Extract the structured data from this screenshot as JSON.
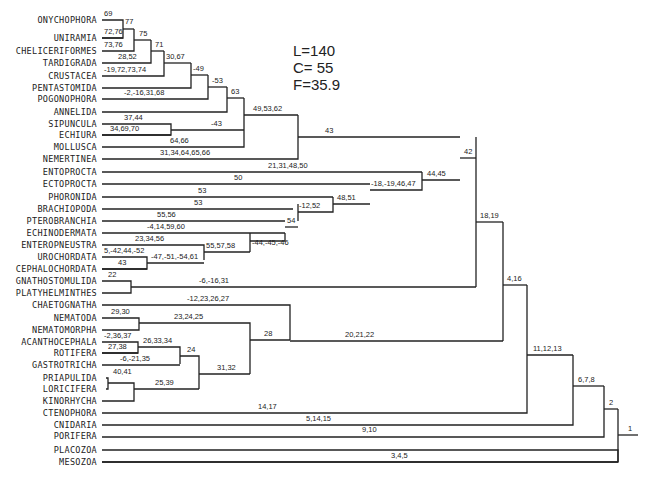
{
  "stats": {
    "L": "L=140",
    "C": "C= 55",
    "F": "F=35.9"
  },
  "taxa": [
    {
      "id": "onychophora",
      "name": "ONYCHOPHORA",
      "y": 20
    },
    {
      "id": "uniramia",
      "name": "UNIRAMIA",
      "y": 38
    },
    {
      "id": "cheliceriformes",
      "name": "CHELICERIFORMES",
      "y": 51
    },
    {
      "id": "tardigrada",
      "name": "TARDIGRADA",
      "y": 63
    },
    {
      "id": "crustacea",
      "name": "CRUSTACEA",
      "y": 76
    },
    {
      "id": "pentastomida",
      "name": "PENTASTOMIDA",
      "y": 88
    },
    {
      "id": "pogonophora",
      "name": "POGONOPHORA",
      "y": 99
    },
    {
      "id": "annelida",
      "name": "ANNELIDA",
      "y": 112
    },
    {
      "id": "sipuncula",
      "name": "SIPUNCULA",
      "y": 124
    },
    {
      "id": "echiura",
      "name": "ECHIURA",
      "y": 135
    },
    {
      "id": "mollusca",
      "name": "MOLLUSCA",
      "y": 147
    },
    {
      "id": "nemertinea",
      "name": "NEMERTINEA",
      "y": 159
    },
    {
      "id": "entoprocta",
      "name": "ENTOPROCTA",
      "y": 172
    },
    {
      "id": "ectoprocta",
      "name": "ECTOPROCTA",
      "y": 184
    },
    {
      "id": "phoronida",
      "name": "PHORONIDA",
      "y": 197
    },
    {
      "id": "brachiopoda",
      "name": "BRACHIOPODA",
      "y": 209
    },
    {
      "id": "pterobranchia",
      "name": "PTEROBRANCHIA",
      "y": 221
    },
    {
      "id": "echinodermata",
      "name": "ECHINODERMATA",
      "y": 233
    },
    {
      "id": "enteropneustra",
      "name": "ENTEROPNEUSTRA",
      "y": 245
    },
    {
      "id": "urochordata",
      "name": "UROCHORDATA",
      "y": 257
    },
    {
      "id": "cephalochordata",
      "name": "CEPHALOCHORDATA",
      "y": 269
    },
    {
      "id": "gnathostomulida",
      "name": "GNATHOSTOMULIDA",
      "y": 281
    },
    {
      "id": "platyhelminthes",
      "name": "PLATYHELMINTHES",
      "y": 293
    },
    {
      "id": "chaetognatha",
      "name": "CHAETOGNATHA",
      "y": 305
    },
    {
      "id": "nematoda",
      "name": "NEMATODA",
      "y": 318
    },
    {
      "id": "nematomorpha",
      "name": "NEMATOMORPHA",
      "y": 330
    },
    {
      "id": "acanthocephala",
      "name": "ACANTHOCEPHALA",
      "y": 342
    },
    {
      "id": "rotifera",
      "name": "ROTIFERA",
      "y": 353
    },
    {
      "id": "gastrotricha",
      "name": "GASTROTRICHA",
      "y": 365
    },
    {
      "id": "priapulida",
      "name": "PRIAPULIDA",
      "y": 378
    },
    {
      "id": "loricifera",
      "name": "LORICIFERA",
      "y": 389
    },
    {
      "id": "kinorhycha",
      "name": "KINORHYCHA",
      "y": 401
    },
    {
      "id": "ctenophora",
      "name": "CTENOPHORA",
      "y": 413
    },
    {
      "id": "cnidaria",
      "name": "CNIDARIA",
      "y": 425
    },
    {
      "id": "porifera",
      "name": "PORIFERA",
      "y": 436
    },
    {
      "id": "placozoa",
      "name": "PLACOZOA",
      "y": 450
    },
    {
      "id": "mesozoa",
      "name": "MESOZOA",
      "y": 462
    }
  ],
  "branches": [
    {
      "d": "M102,20 H123 V38 H102",
      "lx": 104,
      "ly": 16,
      "label": "69"
    },
    {
      "d": "M123,29 H134",
      "lx": 125,
      "ly": 24,
      "label": "77"
    },
    {
      "d": "M102,38 H123",
      "lx": 104,
      "ly": 34,
      "label": "72,76"
    },
    {
      "d": "M102,51 H134 V29",
      "lx": 104,
      "ly": 47,
      "label": "73,76"
    },
    {
      "d": "M134,40 H151",
      "lx": 139,
      "ly": 36,
      "label": "75"
    },
    {
      "d": "M102,63 H151 V40",
      "lx": 118,
      "ly": 59,
      "label": "28,52"
    },
    {
      "d": "M151,51 H164",
      "lx": 155,
      "ly": 47,
      "label": "71"
    },
    {
      "d": "M102,76 H164 V51",
      "lx": 104,
      "ly": 72,
      "label": "-19,72,73,74"
    },
    {
      "d": "M164,63 H191",
      "lx": 166,
      "ly": 59,
      "label": "30,67"
    },
    {
      "d": "M102,88 H191 V63",
      "lx": 0,
      "ly": 0,
      "label": ""
    },
    {
      "d": "M191,75 H208",
      "lx": 193,
      "ly": 71,
      "label": "-49"
    },
    {
      "d": "M102,99 H208 V75",
      "lx": 124,
      "ly": 95,
      "label": "-2,-16,31,68"
    },
    {
      "d": "M208,87 H227",
      "lx": 212,
      "ly": 83,
      "label": "-53"
    },
    {
      "d": "M102,112 H227 V87",
      "lx": 0,
      "ly": 0,
      "label": ""
    },
    {
      "d": "M227,98 H244",
      "lx": 231,
      "ly": 94,
      "label": "63"
    },
    {
      "d": "M102,124 H171 V135 H102",
      "lx": 124,
      "ly": 120,
      "label": "37,44"
    },
    {
      "d": "M171,130 H244",
      "lx": 211,
      "ly": 126,
      "label": "-43"
    },
    {
      "d": "M102,135 H171",
      "lx": 110,
      "ly": 131,
      "label": "34,69,70"
    },
    {
      "d": "M102,147 H244 V98",
      "lx": 170,
      "ly": 143,
      "label": "64,66"
    },
    {
      "d": "M244,115 H298",
      "lx": 253,
      "ly": 111,
      "label": "49,53,62"
    },
    {
      "d": "M102,159 H298 V115",
      "lx": 160,
      "ly": 155,
      "label": "31,34,64,65,66"
    },
    {
      "d": "M298,137 H460",
      "lx": 325,
      "ly": 133,
      "label": "43"
    },
    {
      "d": "M102,172 H422",
      "lx": 268,
      "ly": 168,
      "label": "21,31,48,50"
    },
    {
      "d": "M102,184 H370",
      "lx": 234,
      "ly": 180,
      "label": "50"
    },
    {
      "d": "M102,197 H333",
      "lx": 198,
      "ly": 193,
      "label": "53"
    },
    {
      "d": "M102,209 H293",
      "lx": 194,
      "ly": 205,
      "label": "53"
    },
    {
      "d": "M102,221 H285",
      "lx": 157,
      "ly": 217,
      "label": "55,56"
    },
    {
      "d": "M102,233 H285",
      "lx": 147,
      "ly": 229,
      "label": "-4,14,59,60"
    },
    {
      "d": "M102,245 H204 V260",
      "lx": 135,
      "ly": 241,
      "label": "23,34,56"
    },
    {
      "d": "M102,257 H147 V269 H102",
      "lx": 104,
      "ly": 253,
      "label": "5,-42,44,-52"
    },
    {
      "d": "M147,263 H204",
      "lx": 151,
      "ly": 259,
      "label": "-47,-51,-54,61"
    },
    {
      "d": "M102,269 H147",
      "lx": 118,
      "ly": 265,
      "label": "43"
    },
    {
      "d": "M204,252 H250",
      "lx": 206,
      "ly": 248,
      "label": "55,57,58"
    },
    {
      "d": "M250,241 H285 V233",
      "lx": 0,
      "ly": 0,
      "label": ""
    },
    {
      "d": "M250,233 V252",
      "lx": 252,
      "ly": 245,
      "label": "-44,-45,-46"
    },
    {
      "d": "M285,227 H298",
      "lx": 287,
      "ly": 223,
      "label": "54"
    },
    {
      "d": "M298,212 H333 V197",
      "lx": 299,
      "ly": 208,
      "label": "-12,52"
    },
    {
      "d": "M298,221 V204",
      "lx": 0,
      "ly": 0,
      "label": ""
    },
    {
      "d": "M333,204 H370",
      "lx": 337,
      "ly": 200,
      "label": "48,51"
    },
    {
      "d": "M370,190 H422 V172",
      "lx": 371,
      "ly": 186,
      "label": "-18,-19,46,47"
    },
    {
      "d": "M422,180 H460",
      "lx": 427,
      "ly": 176,
      "label": "44,45"
    },
    {
      "d": "M460,158 H476",
      "lx": 464,
      "ly": 154,
      "label": "42"
    },
    {
      "d": "M102,281 H131 V293 H102",
      "lx": 108,
      "ly": 277,
      "label": "22"
    },
    {
      "d": "M131,287 H476",
      "lx": 199,
      "ly": 283,
      "label": "-6,-16,31"
    },
    {
      "d": "M476,137 V287",
      "lx": 0,
      "ly": 0,
      "label": ""
    },
    {
      "d": "M476,222 H503",
      "lx": 480,
      "ly": 218,
      "label": "18,19"
    },
    {
      "d": "M102,305 H290 V340",
      "lx": 187,
      "ly": 301,
      "label": "-12,23,26,27"
    },
    {
      "d": "M102,318 H139 V330 H102",
      "lx": 111,
      "ly": 314,
      "label": "29,30"
    },
    {
      "d": "M139,323 H250 V374",
      "lx": 174,
      "ly": 319,
      "label": "23,24,25"
    },
    {
      "d": "M102,342 H138 V353 H102",
      "lx": 104,
      "ly": 338,
      "label": "-2,36,37"
    },
    {
      "d": "M138,347 H180 V364",
      "lx": 143,
      "ly": 343,
      "label": "26,33,34"
    },
    {
      "d": "M102,353 H138",
      "lx": 108,
      "ly": 349,
      "label": "27,38"
    },
    {
      "d": "M102,365 H180",
      "lx": 120,
      "ly": 361,
      "label": "-6,-21,35"
    },
    {
      "d": "M180,356 H199 V389",
      "lx": 187,
      "ly": 352,
      "label": "24"
    },
    {
      "d": "M106,378 H108 V389 H106",
      "lx": 113,
      "ly": 374,
      "label": "40,41"
    },
    {
      "d": "M108,383 H134 V401 H102",
      "lx": 0,
      "ly": 0,
      "label": ""
    },
    {
      "d": "M134,389 H199",
      "lx": 155,
      "ly": 385,
      "label": "25,39"
    },
    {
      "d": "M199,374 H250",
      "lx": 217,
      "ly": 370,
      "label": "31,32"
    },
    {
      "d": "M250,340 H290",
      "lx": 264,
      "ly": 336,
      "label": "28"
    },
    {
      "d": "M290,341 H503",
      "lx": 345,
      "ly": 337,
      "label": "20,21,22"
    },
    {
      "d": "M503,222 V341",
      "lx": 0,
      "ly": 0,
      "label": ""
    },
    {
      "d": "M503,285 H527",
      "lx": 507,
      "ly": 281,
      "label": "4,16"
    },
    {
      "d": "M102,413 H527 V285",
      "lx": 258,
      "ly": 409,
      "label": "14,17"
    },
    {
      "d": "M527,355 H573",
      "lx": 533,
      "ly": 351,
      "label": "11,12,13"
    },
    {
      "d": "M102,425 H573 V355",
      "lx": 306,
      "ly": 421,
      "label": "5,14,15"
    },
    {
      "d": "M573,386 H604",
      "lx": 578,
      "ly": 382,
      "label": "6,7,8"
    },
    {
      "d": "M102,437 H604 V386",
      "lx": 362,
      "ly": 432,
      "label": "9,10"
    },
    {
      "d": "M604,409 H618",
      "lx": 609,
      "ly": 405,
      "label": "2"
    },
    {
      "d": "M102,450 H618 V462 H102",
      "lx": 0,
      "ly": 0,
      "label": ""
    },
    {
      "d": "M618,435 H638",
      "lx": 628,
      "ly": 431,
      "label": "1"
    },
    {
      "d": "M102,462 H618",
      "lx": 391,
      "ly": 458,
      "label": "3,4,5"
    }
  ],
  "fixes": [
    {
      "d": "M618,409 V462"
    }
  ]
}
